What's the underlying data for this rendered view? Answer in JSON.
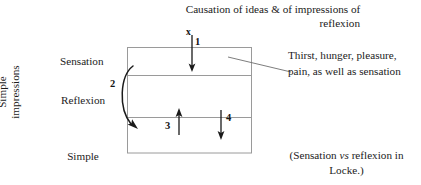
{
  "diagram": {
    "title": {
      "line1": "Causation of ideas & of impressions of",
      "line2": "reflexion"
    },
    "left_group_label": {
      "line1": "Simple",
      "line2": "impressions"
    },
    "row_labels": {
      "sensation": "Sensation",
      "reflexion": "Reflexion",
      "simple_ideas_line1": "Simple",
      "simple_ideas_line2": "Ideas"
    },
    "arrow_markers": {
      "x": "x",
      "one": "1",
      "two": "2",
      "three": "3",
      "four": "4"
    },
    "annotations": {
      "thirst_note": "Thirst, hunger, pleasure, pain, as well as sensation",
      "locke_note_pre": "(Sensation ",
      "locke_note_italic": "vs",
      "locke_note_post": " reflexion in Locke.)"
    },
    "colors": {
      "background": "#ffffff",
      "text": "#1c1c1c",
      "box_stroke": "#8c8c8c",
      "arrow_stroke": "#1a1a1a",
      "leader_stroke": "#6e6e6e"
    },
    "box": {
      "left": 127,
      "top": 47,
      "right": 252,
      "bottom": 153,
      "divider_1_y": 75,
      "divider_2_y": 117
    }
  }
}
